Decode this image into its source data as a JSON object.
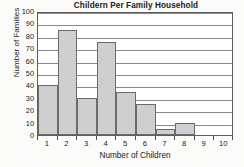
{
  "chart_data": {
    "type": "bar",
    "title": "Childern Per Family Household",
    "xlabel": "Number of Children",
    "ylabel": "Number of Families",
    "categories": [
      "1",
      "2",
      "3",
      "4",
      "5",
      "6",
      "7",
      "8",
      "9",
      "10"
    ],
    "values": [
      40,
      85,
      30,
      75,
      35,
      25,
      5,
      10,
      0,
      0
    ],
    "ylim": [
      0,
      100
    ],
    "yticks": [
      0,
      10,
      20,
      30,
      40,
      50,
      60,
      70,
      80,
      90,
      100
    ],
    "ytick_labels": [
      "0",
      "10",
      "20",
      "30",
      "40",
      "50",
      "60",
      "70",
      "80",
      "90",
      "100"
    ],
    "grid": "horizontal",
    "legend": "none",
    "series": [
      {
        "name": "Number of Families",
        "values": [
          40,
          85,
          30,
          75,
          35,
          25,
          5,
          10,
          0,
          0
        ],
        "bar_fill": "#cfcfcf",
        "bar_border": "#6b6b6b"
      }
    ]
  },
  "colors": {
    "background": "#fbfbfa",
    "plot_background": "#ffffff",
    "axis": "#5e5e5e",
    "gridline": "#8a8a8a",
    "text": "#1a1a1a"
  }
}
